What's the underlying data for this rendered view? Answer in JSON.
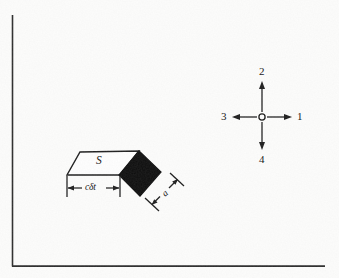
{
  "figure": {
    "background_color": "#fdfdfc",
    "ink_color": "#1a1a1a",
    "fill_color": "#000000",
    "border": {
      "name": "page-border-rule",
      "vertical_x": 12,
      "vertical_y_start": 15,
      "vertical_y_end": 266,
      "horizontal_y": 266,
      "horizontal_x_start": 12,
      "horizontal_x_end": 325
    },
    "surface_diagram": {
      "surface_label": "S",
      "length_label": "cδt",
      "thickness_label": "a",
      "parallelogram": {
        "points": "80,152 139,151 120,175 67,175",
        "fill": "#ffffff",
        "stroke": "#1a1a1a"
      },
      "black_square": {
        "points": "139,151 161,172 140,196 119,175",
        "fill": "#000000",
        "stroke": "#000000"
      },
      "length_dimension": {
        "y": 188,
        "x_start": 67,
        "x_end": 120,
        "tick_top": 176,
        "tick_bottom": 197
      },
      "thickness_dimension": {
        "x_start": 152,
        "y_start": 204,
        "x_end": 178,
        "y_end": 180
      }
    },
    "axis_cross": {
      "center_x": 262,
      "center_y": 117,
      "circle_radius": 3,
      "arm_length": 30,
      "arrows": [
        {
          "id": "1",
          "label": "1",
          "direction": "right"
        },
        {
          "id": "2",
          "label": "2",
          "direction": "up"
        },
        {
          "id": "3",
          "label": "3",
          "direction": "left"
        },
        {
          "id": "4",
          "label": "4",
          "direction": "down"
        }
      ]
    }
  }
}
